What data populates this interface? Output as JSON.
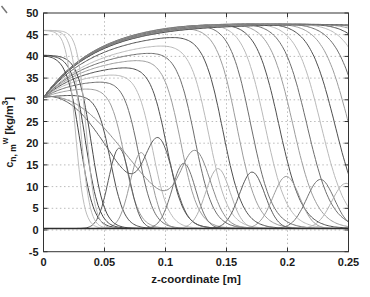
{
  "chart_data": {
    "type": "line",
    "title": "",
    "xlabel": "z-coordinate [m]",
    "ylabel": "c_n,m^w [kg/m3]",
    "ylabel_parts": {
      "base": "c",
      "sub": "n, m",
      "sup": "w",
      "units_open": " [kg/m",
      "units_exp": "3",
      "units_close": "]"
    },
    "xlim": [
      0,
      0.25
    ],
    "ylim": [
      -5,
      50
    ],
    "xticks": {
      "values": [
        0,
        0.05,
        0.1,
        0.15,
        0.2,
        0.25
      ],
      "labels": [
        "0",
        "0.05",
        "0.1",
        "0.15",
        "0.2",
        "0.25"
      ]
    },
    "yticks": {
      "values": [
        -5,
        0,
        5,
        10,
        15,
        20,
        25,
        30,
        35,
        40,
        45,
        50
      ],
      "labels": [
        "-5",
        "0",
        "5",
        "10",
        "15",
        "20",
        "25",
        "30",
        "35",
        "40",
        "45",
        "50"
      ]
    },
    "grid": "dotted",
    "legend": "none",
    "background": "#ffffff",
    "axis_color": "#333333",
    "grid_color": "#aaaaaa",
    "text_color": "#1a1a1a",
    "front_color_cycle": [
      "#4f4f4f",
      "#9c9c9c",
      "#6d6d6d",
      "#b9b9b9"
    ],
    "pulse_color_cycle": [
      "#5a5a5a",
      "#9a9a9a",
      "#717171",
      "#b0b0b0"
    ],
    "series_model": {
      "description": "Concentration profiles c(z) at successive time steps: rising fronts from inlet value 30.5 up to a plateau near 49 that advance rightward, travelling pulses of height 10-18, steep initial profiles near z=0.03-0.05, and a residual baseline near 0.35",
      "inlet_concentration": 30.5,
      "plateau": {
        "intercept": 49.4,
        "slope_per_m": -6
      },
      "front_family": {
        "name": "advancing-fronts",
        "front_positions_m": [
          0.055,
          0.0665,
          0.078,
          0.0895,
          0.101,
          0.1125,
          0.124,
          0.1355,
          0.147,
          0.1585,
          0.17,
          0.1815,
          0.193,
          0.2045,
          0.216,
          0.2275,
          0.239,
          0.2505,
          0.262,
          0.2735,
          0.285,
          0.2965,
          0.308,
          0.3195,
          0.331
        ],
        "amp_ramp": {
          "start": 0.05,
          "span": 0.115,
          "base": 30.5,
          "gain": 18.5
        },
        "rise_tau": {
          "factor": 0.33,
          "min": 0.012,
          "max": 0.045
        },
        "fall_width": {
          "base": 0.004,
          "factor": 0.028
        }
      },
      "pulse_family": {
        "name": "travelling-pulses",
        "peak_x_m": [
          0.062,
          0.08,
          0.115,
          0.143,
          0.171,
          0.199,
          0.227,
          0.248
        ],
        "peak_height": [
          18.5,
          17.5,
          15.0,
          13.8,
          13.0,
          12.0,
          11.3,
          10.4
        ],
        "width": {
          "base": 0.011,
          "factor": 0.022
        }
      },
      "wiggle_profiles": [
        {
          "start_value": 30.5,
          "decay_scale": 0.07,
          "decay_power": 2.4,
          "pulse_amp": 17.0,
          "pulse_x": 0.095,
          "pulse_width": 0.016,
          "color": "#5f5f5f"
        },
        {
          "start_value": 30.5,
          "decay_scale": 0.085,
          "decay_power": 2.4,
          "pulse_amp": 15.5,
          "pulse_x": 0.125,
          "pulse_width": 0.017,
          "color": "#8b8b8b"
        }
      ],
      "initial_fronts_dark": {
        "start_value": 40.3,
        "midpoints_m": [
          0.03,
          0.0345,
          0.039
        ],
        "width": 0.0055,
        "color": "#474747"
      },
      "initial_fronts_light": {
        "start_value": 46.0,
        "midpoints_m": [
          0.026,
          0.0305,
          0.035
        ],
        "width": 0.0037,
        "color": "#bcbcbc"
      },
      "baseline": {
        "value": 0.35,
        "color": "#2f2f2f"
      }
    }
  }
}
